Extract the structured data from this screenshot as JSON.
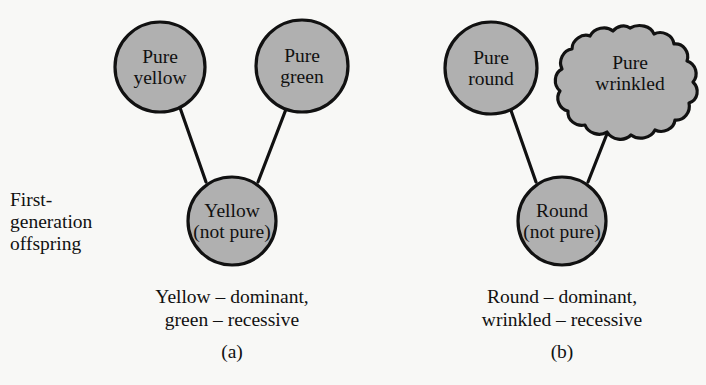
{
  "figure": {
    "type": "genetics-inheritance-diagram",
    "background_color": "#f8f8f6",
    "node_fill_color": "#b0b0b0",
    "node_stroke_color": "#111111",
    "text_color": "#111111",
    "generation_label": {
      "lines": [
        "First-",
        "generation",
        "offspring"
      ]
    },
    "panels": [
      {
        "id": "a",
        "letter": "(a)",
        "caption_lines": [
          "Yellow – dominant,",
          "green – recessive"
        ],
        "parents": [
          {
            "name": "pure-yellow",
            "shape": "circle",
            "label_lines": [
              "Pure",
              "yellow"
            ]
          },
          {
            "name": "pure-green",
            "shape": "circle",
            "label_lines": [
              "Pure",
              "green"
            ]
          }
        ],
        "offspring": {
          "name": "yellow-not-pure",
          "shape": "circle",
          "label_lines": [
            "Yellow",
            "(not pure)"
          ]
        }
      },
      {
        "id": "b",
        "letter": "(b)",
        "caption_lines": [
          "Round – dominant,",
          "wrinkled – recessive"
        ],
        "parents": [
          {
            "name": "pure-round",
            "shape": "circle",
            "label_lines": [
              "Pure",
              "round"
            ]
          },
          {
            "name": "pure-wrinkled",
            "shape": "scalloped-blob",
            "label_lines": [
              "Pure",
              "wrinkled"
            ]
          }
        ],
        "offspring": {
          "name": "round-not-pure",
          "shape": "circle",
          "label_lines": [
            "Round",
            "(not pure)"
          ]
        }
      }
    ]
  }
}
